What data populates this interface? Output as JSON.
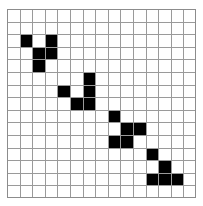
{
  "figure": {
    "background_color": "#ffffff",
    "grid_line_color": "#9a9a9a",
    "grid_border_color": "#8c8c8c",
    "fill_color": "#000000"
  },
  "grid": {
    "columns": 15,
    "rows": 15,
    "cell_size_px": 12.6,
    "origin_x_px": 7,
    "origin_y_px": 9,
    "width_px": 189,
    "height_px": 189
  },
  "chart_data": {
    "type": "heatmap",
    "xlabel": "",
    "ylabel": "",
    "columns": 15,
    "rows": 15,
    "legend": [
      {
        "label": "filled",
        "color": "#000000",
        "value": 1
      },
      {
        "label": "empty",
        "color": "#ffffff",
        "value": 0
      }
    ],
    "filled_cells": [
      {
        "col": 1,
        "row": 2
      },
      {
        "col": 3,
        "row": 2
      },
      {
        "col": 2,
        "row": 3
      },
      {
        "col": 3,
        "row": 3
      },
      {
        "col": 2,
        "row": 4
      },
      {
        "col": 6,
        "row": 5
      },
      {
        "col": 4,
        "row": 6
      },
      {
        "col": 6,
        "row": 6
      },
      {
        "col": 5,
        "row": 7
      },
      {
        "col": 6,
        "row": 7
      },
      {
        "col": 8,
        "row": 8
      },
      {
        "col": 9,
        "row": 9
      },
      {
        "col": 10,
        "row": 9
      },
      {
        "col": 8,
        "row": 10
      },
      {
        "col": 9,
        "row": 10
      },
      {
        "col": 11,
        "row": 11
      },
      {
        "col": 12,
        "row": 12
      },
      {
        "col": 11,
        "row": 13
      },
      {
        "col": 12,
        "row": 13
      },
      {
        "col": 13,
        "row": 13
      }
    ],
    "matrix": [
      [
        0,
        0,
        0,
        0,
        0,
        0,
        0,
        0,
        0,
        0,
        0,
        0,
        0,
        0,
        0
      ],
      [
        0,
        0,
        0,
        0,
        0,
        0,
        0,
        0,
        0,
        0,
        0,
        0,
        0,
        0,
        0
      ],
      [
        0,
        1,
        0,
        1,
        0,
        0,
        0,
        0,
        0,
        0,
        0,
        0,
        0,
        0,
        0
      ],
      [
        0,
        0,
        1,
        1,
        0,
        0,
        0,
        0,
        0,
        0,
        0,
        0,
        0,
        0,
        0
      ],
      [
        0,
        0,
        1,
        0,
        0,
        0,
        0,
        0,
        0,
        0,
        0,
        0,
        0,
        0,
        0
      ],
      [
        0,
        0,
        0,
        0,
        0,
        0,
        1,
        0,
        0,
        0,
        0,
        0,
        0,
        0,
        0
      ],
      [
        0,
        0,
        0,
        0,
        1,
        0,
        1,
        0,
        0,
        0,
        0,
        0,
        0,
        0,
        0
      ],
      [
        0,
        0,
        0,
        0,
        0,
        1,
        1,
        0,
        0,
        0,
        0,
        0,
        0,
        0,
        0
      ],
      [
        0,
        0,
        0,
        0,
        0,
        0,
        0,
        0,
        1,
        0,
        0,
        0,
        0,
        0,
        0
      ],
      [
        0,
        0,
        0,
        0,
        0,
        0,
        0,
        0,
        0,
        1,
        1,
        0,
        0,
        0,
        0
      ],
      [
        0,
        0,
        0,
        0,
        0,
        0,
        0,
        0,
        1,
        1,
        0,
        0,
        0,
        0,
        0
      ],
      [
        0,
        0,
        0,
        0,
        0,
        0,
        0,
        0,
        0,
        0,
        0,
        1,
        0,
        0,
        0
      ],
      [
        0,
        0,
        0,
        0,
        0,
        0,
        0,
        0,
        0,
        0,
        0,
        0,
        1,
        0,
        0
      ],
      [
        0,
        0,
        0,
        0,
        0,
        0,
        0,
        0,
        0,
        0,
        0,
        1,
        1,
        1,
        0
      ],
      [
        0,
        0,
        0,
        0,
        0,
        0,
        0,
        0,
        0,
        0,
        0,
        0,
        0,
        0,
        0
      ]
    ],
    "filled_count": 20,
    "empty_count": 205,
    "total_cells": 225
  }
}
